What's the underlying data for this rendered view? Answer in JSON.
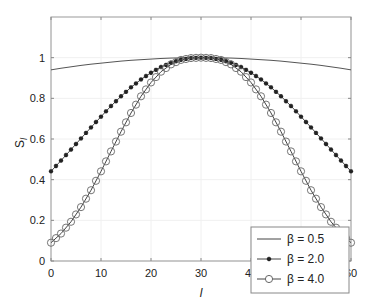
{
  "chart_data": {
    "type": "line",
    "title": "",
    "xlabel": "l",
    "ylabel": "S_l",
    "xlim": [
      0,
      60
    ],
    "ylim": [
      0,
      1.2
    ],
    "xticks": [
      0,
      10,
      20,
      30,
      40,
      50,
      60
    ],
    "yticks": [
      0,
      0.2,
      0.4,
      0.6,
      0.8,
      1
    ],
    "ytick_labels": [
      "0",
      "0.2",
      "0.4",
      "0.6",
      "0.8",
      "1"
    ],
    "grid": true,
    "legend_position": "lower right",
    "x": [
      0,
      2,
      4,
      6,
      8,
      10,
      12,
      14,
      16,
      18,
      20,
      22,
      24,
      26,
      28,
      30,
      32,
      34,
      36,
      38,
      40,
      42,
      44,
      46,
      48,
      50,
      52,
      54,
      56,
      58,
      60
    ],
    "series": [
      {
        "name": "β = 0.5",
        "marker": "none",
        "values": [
          0.94,
          0.948,
          0.955,
          0.962,
          0.968,
          0.973,
          0.978,
          0.983,
          0.987,
          0.99,
          0.993,
          0.996,
          0.998,
          0.999,
          1.0,
          1.0,
          1.0,
          0.999,
          0.998,
          0.996,
          0.993,
          0.99,
          0.987,
          0.983,
          0.978,
          0.973,
          0.968,
          0.962,
          0.955,
          0.948,
          0.94
        ]
      },
      {
        "name": "β = 2.0",
        "marker": "star",
        "values": [
          0.441,
          0.494,
          0.548,
          0.603,
          0.657,
          0.71,
          0.762,
          0.81,
          0.854,
          0.893,
          0.926,
          0.954,
          0.975,
          0.99,
          0.998,
          1.0,
          0.998,
          0.99,
          0.975,
          0.954,
          0.926,
          0.893,
          0.854,
          0.81,
          0.762,
          0.71,
          0.657,
          0.603,
          0.548,
          0.494,
          0.441
        ]
      },
      {
        "name": "β = 4.0",
        "marker": "circle",
        "values": [
          0.09,
          0.135,
          0.193,
          0.265,
          0.348,
          0.441,
          0.539,
          0.636,
          0.728,
          0.81,
          0.878,
          0.931,
          0.967,
          0.989,
          0.998,
          1.0,
          0.998,
          0.989,
          0.967,
          0.931,
          0.878,
          0.81,
          0.728,
          0.636,
          0.539,
          0.441,
          0.348,
          0.265,
          0.193,
          0.135,
          0.09
        ]
      }
    ]
  },
  "legend": [
    "β = 0.5",
    "β = 2.0",
    "β = 4.0"
  ]
}
